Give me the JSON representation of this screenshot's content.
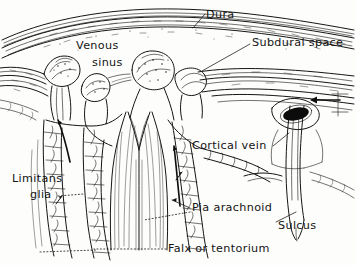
{
  "figure": {
    "style": "pen-and-ink anatomical line drawing",
    "background_color": "#fdfdfc",
    "ink_color": "#151515"
  },
  "labels": [
    {
      "id": "dura",
      "text": "Dura",
      "x": 206,
      "y": 18,
      "anchor": "start",
      "leader": {
        "type": "solid",
        "points": "204,14 193,27"
      }
    },
    {
      "id": "subdural-space",
      "text": "Subdural space",
      "x": 252,
      "y": 46,
      "anchor": "start",
      "leader": {
        "type": "solid",
        "points": "250,44 200,70"
      }
    },
    {
      "id": "venous-sinus-line1",
      "text": "Venous",
      "x": 76,
      "y": 49,
      "anchor": "start",
      "leader": null
    },
    {
      "id": "venous-sinus-line2",
      "text": "sinus",
      "x": 92,
      "y": 66,
      "anchor": "start",
      "leader": null
    },
    {
      "id": "cortical-vein",
      "text": "Cortical vein",
      "x": 192,
      "y": 149,
      "anchor": "start",
      "leader": {
        "type": "solid",
        "points": "274,146 288,134"
      }
    },
    {
      "id": "limitans-glia-line1",
      "text": "Limitans",
      "x": 12,
      "y": 182,
      "anchor": "start",
      "leader": null
    },
    {
      "id": "limitans-glia-line2",
      "text": "glia",
      "x": 30,
      "y": 198,
      "anchor": "start",
      "leader": {
        "type": "dotted",
        "points": "58,196 82,194"
      }
    },
    {
      "id": "pia-arachnoid",
      "text": "Pia arachnoid",
      "x": 192,
      "y": 211,
      "anchor": "start",
      "leader": {
        "type": "dotted",
        "points": "190,214 146,220"
      }
    },
    {
      "id": "sulcus",
      "text": "Sulcus",
      "x": 278,
      "y": 229,
      "anchor": "start",
      "leader": {
        "type": "solid",
        "points": "276,222 294,213"
      }
    },
    {
      "id": "falx-or-tentorium",
      "text": "Falx or tentorium",
      "x": 168,
      "y": 252,
      "anchor": "start",
      "leader": {
        "type": "dotted",
        "points": "166,249 96,249"
      }
    }
  ],
  "structures": [
    {
      "id": "dura-band",
      "name": "dura mater band"
    },
    {
      "id": "venous-sinus-lumen",
      "name": "superior sagittal sinus lumen"
    },
    {
      "id": "arachnoid-granulations",
      "name": "arachnoid granulations"
    },
    {
      "id": "falx-cerebri",
      "name": "falx cerebri septum"
    },
    {
      "id": "cortical-surface",
      "name": "cortical surface cell layer"
    },
    {
      "id": "cortical-vein-vessel",
      "name": "cortical vein with dark lumen"
    },
    {
      "id": "sulcus-cleft",
      "name": "sulcus cleft"
    }
  ]
}
